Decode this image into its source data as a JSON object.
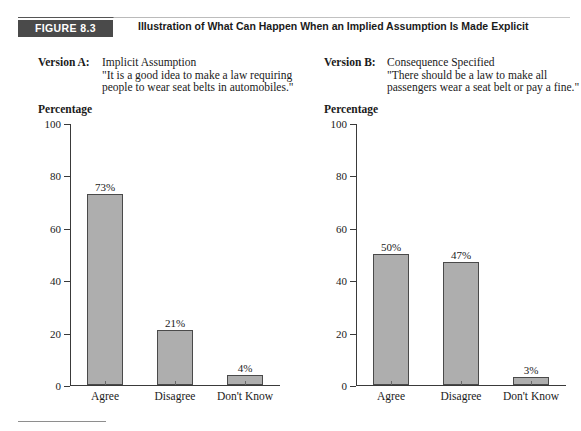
{
  "figure": {
    "badge": "FIGURE 8.3",
    "title": "Illustration of What Can Happen When an Implied Assumption Is Made Explicit",
    "badge_color": "#4a4a4a",
    "bar_fill_color": "#aeaeae",
    "bar_border_color": "#4a4a4a",
    "axis_color": "#3a3a3a"
  },
  "versions": [
    {
      "label": "Version A:",
      "heading": "Implicit Assumption",
      "quote_line_1": "\"It is a good idea to make a law requiring",
      "quote_line_2": "people to wear seat belts in automobiles.\"",
      "axis_title": "Percentage"
    },
    {
      "label": "Version B:",
      "heading": "Consequence Specified",
      "quote_line_1": "\"There should be a law to make all",
      "quote_line_2": "passengers wear a seat belt or pay a fine.\"",
      "axis_title": "Percentage"
    }
  ],
  "chart_data": [
    {
      "type": "bar",
      "title": "Version A: Implicit Assumption",
      "categories": [
        "Agree",
        "Disagree",
        "Don't Know"
      ],
      "values": [
        73,
        21,
        4
      ],
      "data_labels": [
        "73%",
        "21%",
        "4%"
      ],
      "xlabel": "",
      "ylabel": "Percentage",
      "ylim": [
        0,
        100
      ],
      "yticks": [
        0,
        20,
        40,
        60,
        80,
        100
      ],
      "ytick_labels": [
        "0",
        "20",
        "40",
        "60",
        "80",
        "100"
      ],
      "grid": false,
      "legend": false
    },
    {
      "type": "bar",
      "title": "Version B: Consequence Specified",
      "categories": [
        "Agree",
        "Disagree",
        "Don't Know"
      ],
      "values": [
        50,
        47,
        3
      ],
      "data_labels": [
        "50%",
        "47%",
        "3%"
      ],
      "xlabel": "",
      "ylabel": "Percentage",
      "ylim": [
        0,
        100
      ],
      "yticks": [
        0,
        20,
        40,
        60,
        80,
        100
      ],
      "ytick_labels": [
        "0",
        "20",
        "40",
        "60",
        "80",
        "100"
      ],
      "grid": false,
      "legend": false
    }
  ]
}
